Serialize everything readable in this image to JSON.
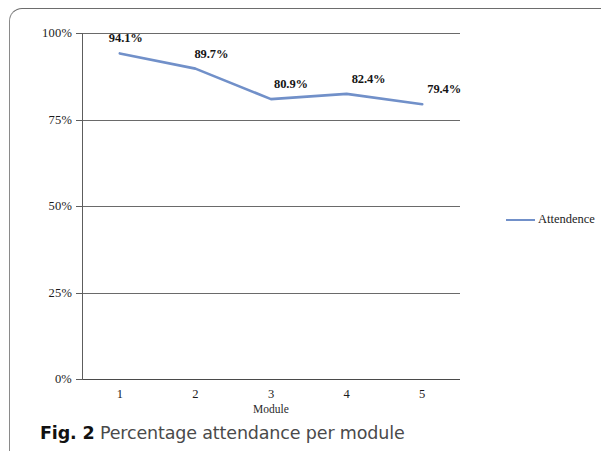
{
  "caption": {
    "number": "Fig. 2",
    "text": "Percentage attendance per module"
  },
  "legend": {
    "position": "right",
    "entries": [
      {
        "label": "Attendence",
        "color": "#7190c9",
        "marker": "line"
      }
    ]
  },
  "chart_data": {
    "type": "line",
    "title": "",
    "subtitle": "",
    "xlabel": "Module",
    "ylabel": "",
    "categories": [
      "1",
      "2",
      "3",
      "4",
      "5"
    ],
    "x": [
      1,
      2,
      3,
      4,
      5
    ],
    "values": [
      94.1,
      89.7,
      80.9,
      82.4,
      79.4
    ],
    "data_labels": [
      "94.1%",
      "89.7%",
      "80.9%",
      "82.4%",
      "79.4%"
    ],
    "series": [
      {
        "name": "Attendence",
        "color": "#7190c9",
        "values": [
          94.1,
          89.7,
          80.9,
          82.4,
          79.4
        ]
      }
    ],
    "ylim": [
      0,
      100
    ],
    "yticks": [
      0,
      25,
      50,
      75,
      100
    ],
    "ytick_labels": [
      "0%",
      "25%",
      "50%",
      "75%",
      "100%"
    ],
    "xtick_labels": [
      "1",
      "2",
      "3",
      "4",
      "5"
    ],
    "grid": true,
    "grid_axis": "y",
    "legend_position": "right",
    "line_color": "#7190c9",
    "axis_color": "#5d5d5d",
    "background": "#ffffff"
  }
}
